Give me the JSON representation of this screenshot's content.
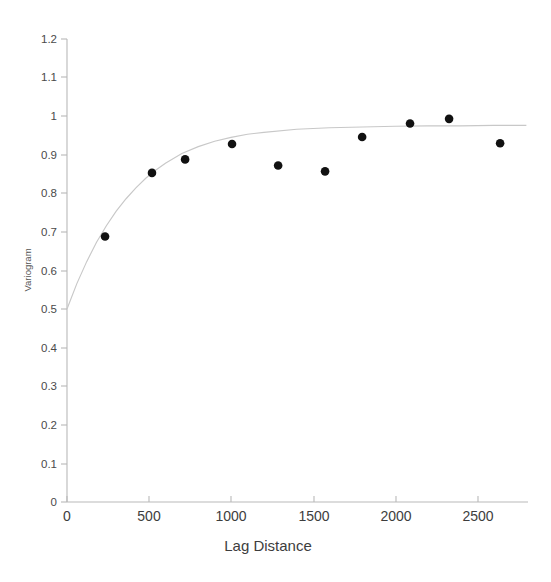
{
  "chart_data": {
    "type": "scatter",
    "title": "",
    "subtitle": "",
    "xlabel": "Lag Distance",
    "ylabel": "Variogram",
    "xlim": [
      0,
      2810
    ],
    "ylim": [
      0,
      1.2
    ],
    "grid": false,
    "legend": null,
    "xticks": [
      0,
      500,
      1000,
      1500,
      2000,
      2500
    ],
    "xtick_labels": [
      "0",
      "500",
      "1000",
      "1500",
      "2000",
      "2500"
    ],
    "yticks": [
      0,
      0.1,
      0.2,
      0.3,
      0.4,
      0.5,
      0.6,
      0.7,
      0.8,
      0.9,
      1.0,
      1.1,
      1.2
    ],
    "ytick_labels": [
      "0",
      "0.1",
      "0.2",
      "0.3",
      "0.4",
      "0.5",
      "0.6",
      "0.7",
      "0.8",
      "0.9",
      "1",
      "1.1",
      "1.2"
    ],
    "series": [
      {
        "name": "Experimental variogram",
        "type": "scatter",
        "marker": "filled-circle",
        "color": "#111111",
        "x": [
          232,
          518,
          720,
          1006,
          1287,
          1573,
          1799,
          2091,
          2329,
          2640
        ],
        "y": [
          0.688,
          0.853,
          0.888,
          0.928,
          0.872,
          0.857,
          0.946,
          0.981,
          0.993,
          0.93
        ]
      },
      {
        "name": "Fitted exponential model",
        "type": "line",
        "color": "#c8c8c8",
        "nugget": 0.5,
        "sill": 0.975,
        "range": 1200,
        "x": [
          0,
          60,
          120,
          180,
          240,
          300,
          360,
          420,
          480,
          540,
          600,
          700,
          800,
          900,
          1000,
          1100,
          1200,
          1400,
          1600,
          1800,
          2000,
          2200,
          2400,
          2600,
          2800
        ],
        "y": [
          0.5,
          0.566,
          0.623,
          0.673,
          0.716,
          0.754,
          0.786,
          0.814,
          0.839,
          0.86,
          0.878,
          0.903,
          0.921,
          0.935,
          0.945,
          0.953,
          0.958,
          0.966,
          0.97,
          0.972,
          0.974,
          0.975,
          0.975,
          0.976,
          0.976
        ]
      }
    ]
  },
  "axes": {
    "x_title": "Lag Distance",
    "y_title": "Variogram"
  },
  "colors": {
    "point": "#111111",
    "curve": "#c8c8c8",
    "axis": "#b9b9b9",
    "text": "#3d3d3d",
    "background": "#ffffff"
  }
}
